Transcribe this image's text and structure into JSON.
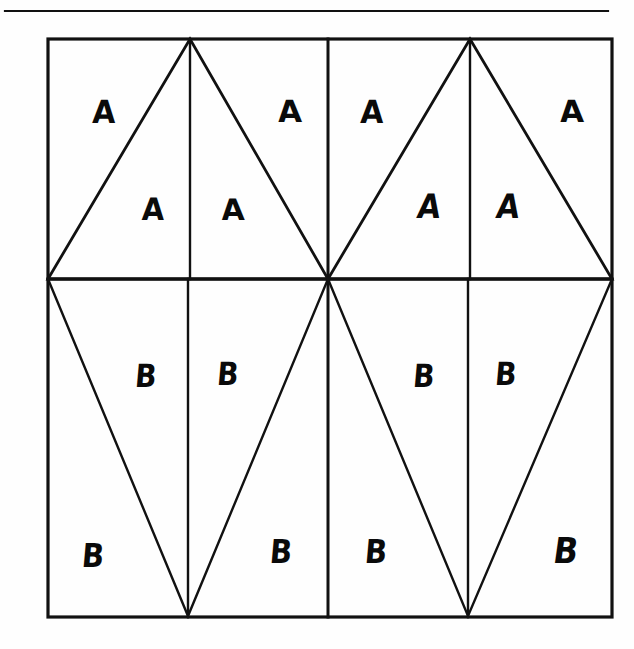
{
  "figure": {
    "name": "triangle-tiling-diagram",
    "background_color": "#fefefe",
    "ink_color": "#111111",
    "top_rule": {
      "x1": 5,
      "y1": 11,
      "x2": 608,
      "y2": 11,
      "stroke_width": 2.2
    },
    "frame": {
      "left": 48,
      "top": 39,
      "right": 612,
      "bottom": 617,
      "stroke_width": 3.2
    },
    "guide_lines": [
      {
        "name": "midline-horizontal",
        "x1": 48,
        "y1": 279,
        "x2": 612,
        "y2": 279,
        "stroke_width": 3.0
      },
      {
        "name": "center-vertical",
        "x1": 328,
        "y1": 39,
        "x2": 328,
        "y2": 617,
        "stroke_width": 3.0
      },
      {
        "name": "apex-vertical-left",
        "x1": 190,
        "y1": 39,
        "x2": 190,
        "y2": 279,
        "stroke_width": 2.4
      },
      {
        "name": "apex-vertical-right",
        "x1": 470,
        "y1": 39,
        "x2": 470,
        "y2": 279,
        "stroke_width": 2.4
      },
      {
        "name": "nadir-vertical-left",
        "x1": 188,
        "y1": 279,
        "x2": 188,
        "y2": 617,
        "stroke_width": 2.4
      },
      {
        "name": "nadir-vertical-right",
        "x1": 468,
        "y1": 279,
        "x2": 468,
        "y2": 617,
        "stroke_width": 2.4
      }
    ],
    "triangles": [
      {
        "name": "upper-triangle-left",
        "points": "48,279 190,39 328,279",
        "stroke_width": 2.8
      },
      {
        "name": "upper-triangle-right",
        "points": "328,279 470,39 612,279",
        "stroke_width": 2.8
      },
      {
        "name": "lower-triangle-left",
        "points": "48,279 188,616 328,279",
        "stroke_width": 2.4
      },
      {
        "name": "lower-triangle-right",
        "points": "328,279 468,616 612,279",
        "stroke_width": 2.4
      }
    ],
    "labels": [
      {
        "text": "A",
        "x": 104,
        "y": 113,
        "size": 30,
        "style": "skew-a",
        "region": "upper-outer-left-1"
      },
      {
        "text": "A",
        "x": 290,
        "y": 113,
        "size": 30,
        "style": "skew-c",
        "region": "upper-outer-left-2"
      },
      {
        "text": "A",
        "x": 372,
        "y": 113,
        "size": 30,
        "style": "skew-a",
        "region": "upper-outer-right-1"
      },
      {
        "text": "A",
        "x": 572,
        "y": 113,
        "size": 30,
        "style": "skew-c",
        "region": "upper-outer-right-2"
      },
      {
        "text": "A",
        "x": 153,
        "y": 210,
        "size": 29,
        "style": "skew-a",
        "region": "upper-inner-left-1"
      },
      {
        "text": "A",
        "x": 233,
        "y": 210,
        "size": 29,
        "style": "skew-c",
        "region": "upper-inner-left-2"
      },
      {
        "text": "A",
        "x": 429,
        "y": 208,
        "size": 30,
        "style": "skew-d",
        "region": "upper-inner-right-1"
      },
      {
        "text": "A",
        "x": 508,
        "y": 208,
        "size": 30,
        "style": "skew-d",
        "region": "upper-inner-right-2"
      },
      {
        "text": "B",
        "x": 146,
        "y": 377,
        "size": 29,
        "style": "skew-b",
        "region": "lower-inner-left-1"
      },
      {
        "text": "B",
        "x": 228,
        "y": 375,
        "size": 29,
        "style": "skew-b",
        "region": "lower-inner-left-2"
      },
      {
        "text": "B",
        "x": 424,
        "y": 377,
        "size": 29,
        "style": "skew-b",
        "region": "lower-inner-right-1"
      },
      {
        "text": "B",
        "x": 506,
        "y": 375,
        "size": 29,
        "style": "skew-b",
        "region": "lower-inner-right-2"
      },
      {
        "text": "B",
        "x": 93,
        "y": 557,
        "size": 30,
        "style": "skew-b",
        "region": "lower-outer-left-1"
      },
      {
        "text": "B",
        "x": 281,
        "y": 553,
        "size": 30,
        "style": "skew-b",
        "region": "lower-outer-left-2"
      },
      {
        "text": "B",
        "x": 376,
        "y": 553,
        "size": 30,
        "style": "skew-b",
        "region": "lower-outer-right-1"
      },
      {
        "text": "B",
        "x": 566,
        "y": 551,
        "size": 32,
        "style": "skew-d",
        "region": "lower-outer-right-2"
      }
    ]
  }
}
